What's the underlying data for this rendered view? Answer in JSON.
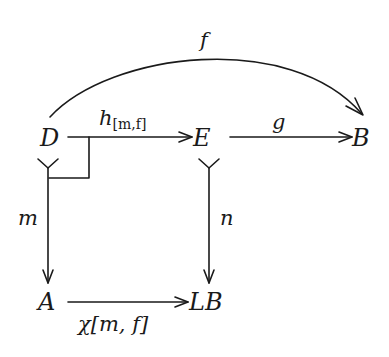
{
  "diagram": {
    "type": "commutative-diagram",
    "colors": {
      "stroke": "#1a1a1a",
      "background": "#ffffff"
    },
    "nodes": {
      "D": "D",
      "E": "E",
      "B": "B",
      "A": "A",
      "LB": "LB"
    },
    "edges": {
      "f": {
        "from": "D",
        "to": "B",
        "label": "f",
        "style": "curved-arrow"
      },
      "h": {
        "from": "D",
        "to": "E",
        "label_main": "h",
        "label_sub": "[m,f]",
        "style": "arrow"
      },
      "g": {
        "from": "E",
        "to": "B",
        "label": "g",
        "style": "arrow"
      },
      "m": {
        "from": "D",
        "to": "A",
        "label": "m",
        "style": "mono-arrow"
      },
      "n": {
        "from": "E",
        "to": "LB",
        "label": "n",
        "style": "mono-arrow"
      },
      "chi": {
        "from": "A",
        "to": "LB",
        "label_main": "χ",
        "label_bracket": "[m, f]",
        "style": "arrow"
      }
    },
    "annotations": {
      "pullback_corner": "pullback-square-marker"
    }
  }
}
